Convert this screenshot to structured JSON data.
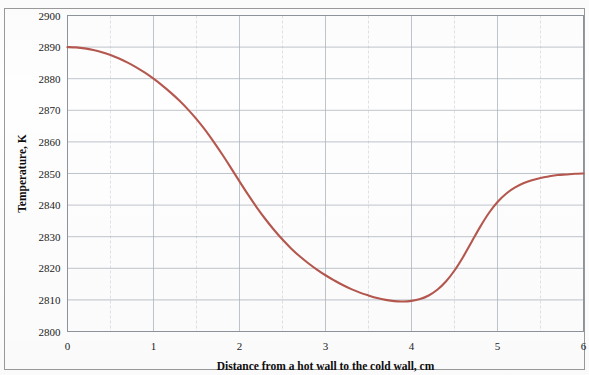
{
  "chart_data": {
    "type": "line",
    "title": "",
    "xlabel": "Distance from a hot wall to the cold wall, cm",
    "ylabel": "Temperature, K",
    "xlim": [
      0,
      6
    ],
    "ylim": [
      2800,
      2900
    ],
    "xticks": [
      "0",
      "1",
      "2",
      "3",
      "4",
      "5",
      "6"
    ],
    "yticks": [
      "2800",
      "2810",
      "2820",
      "2830",
      "2840",
      "2850",
      "2860",
      "2870",
      "2880",
      "2890",
      "2900"
    ],
    "xtick_step": 1,
    "ytick_step": 10,
    "minor_x_step": 0.5,
    "grid": true,
    "legend": "none",
    "series": [
      {
        "name": "Temperature profile",
        "color": "#b5584f",
        "x": [
          0.0,
          0.1,
          0.2,
          0.3,
          0.4,
          0.5,
          0.6,
          0.7,
          0.8,
          0.9,
          1.0,
          1.1,
          1.2,
          1.3,
          1.4,
          1.5,
          1.6,
          1.7,
          1.8,
          1.9,
          2.0,
          2.1,
          2.2,
          2.3,
          2.4,
          2.5,
          2.6,
          2.7,
          2.8,
          2.9,
          3.0,
          3.1,
          3.2,
          3.3,
          3.4,
          3.5,
          3.6,
          3.7,
          3.8,
          3.9,
          4.0,
          4.1,
          4.2,
          4.3,
          4.4,
          4.5,
          4.6,
          4.7,
          4.8,
          4.9,
          5.0,
          5.1,
          5.2,
          5.3,
          5.4,
          5.5,
          5.6,
          5.7,
          5.8,
          5.9,
          6.0
        ],
        "y": [
          2890.0,
          2889.9,
          2889.6,
          2889.1,
          2888.4,
          2887.5,
          2886.4,
          2885.1,
          2883.6,
          2881.9,
          2880.0,
          2877.9,
          2875.6,
          2873.1,
          2870.3,
          2867.2,
          2863.8,
          2860.0,
          2856.0,
          2851.8,
          2847.5,
          2843.3,
          2839.3,
          2835.6,
          2832.2,
          2829.1,
          2826.3,
          2823.8,
          2821.6,
          2819.6,
          2817.8,
          2816.2,
          2814.7,
          2813.4,
          2812.3,
          2811.4,
          2810.6,
          2810.0,
          2809.6,
          2809.5,
          2809.7,
          2810.3,
          2811.4,
          2813.2,
          2815.8,
          2819.3,
          2823.6,
          2828.4,
          2833.2,
          2837.5,
          2841.0,
          2843.6,
          2845.5,
          2846.9,
          2847.9,
          2848.6,
          2849.1,
          2849.5,
          2849.7,
          2849.9,
          2850.0
        ]
      }
    ],
    "annotations": []
  },
  "axes": {
    "y_title": "Temperature, K",
    "x_title": "Distance from a hot wall to the cold wall, cm"
  }
}
